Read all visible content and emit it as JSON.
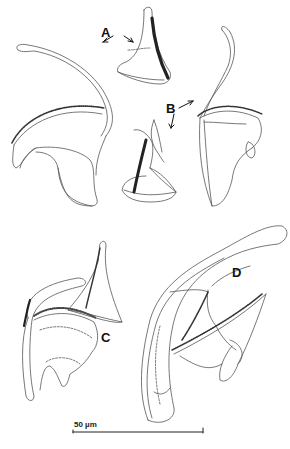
{
  "figure": {
    "panels": [
      {
        "id": "A",
        "label": "A",
        "description": "Ventral bar and hook pair, view 1"
      },
      {
        "id": "B",
        "label": "B",
        "description": "Ventral bar and hook pair, view 2"
      },
      {
        "id": "C",
        "label": "C",
        "description": "Anchor with bar, view 3"
      },
      {
        "id": "D",
        "label": "D",
        "description": "Anchor with bar, view 4"
      }
    ],
    "labels": {
      "A": "A",
      "B": "B",
      "C": "C",
      "D": "D"
    },
    "scale_bar": {
      "text": "50 µm",
      "length_px": 130
    },
    "colors": {
      "line": "#555555",
      "dark_fill": "#222222",
      "background": "#ffffff"
    }
  }
}
